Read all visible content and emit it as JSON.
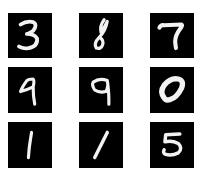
{
  "grid": {
    "rows": 3,
    "cols": 3,
    "tile_color": "#000000",
    "stroke_color": "#f2f2f2",
    "background": "#ffffff"
  },
  "digits": [
    {
      "label": "3",
      "row": 0,
      "col": 0
    },
    {
      "label": "8",
      "row": 0,
      "col": 1
    },
    {
      "label": "7",
      "row": 0,
      "col": 2
    },
    {
      "label": "9",
      "row": 1,
      "col": 0
    },
    {
      "label": "9",
      "row": 1,
      "col": 1
    },
    {
      "label": "0",
      "row": 1,
      "col": 2
    },
    {
      "label": "1",
      "row": 2,
      "col": 0
    },
    {
      "label": "1",
      "row": 2,
      "col": 1
    },
    {
      "label": "5",
      "row": 2,
      "col": 2
    }
  ]
}
